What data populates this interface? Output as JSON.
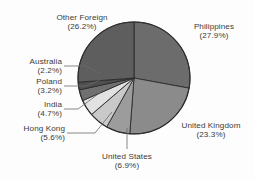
{
  "chart_data": {
    "type": "pie",
    "title": "",
    "subtitle": "",
    "xlabel": "",
    "ylabel": "",
    "legend_position": "none",
    "grid": false,
    "value_unit": "percent",
    "start_angle_deg": 0,
    "direction": "clockwise",
    "categories": [
      "Philippines",
      "United Kingdom",
      "United States",
      "Hong Kong",
      "India",
      "Poland",
      "Australia",
      "Other Foreign"
    ],
    "values": [
      27.9,
      23.3,
      6.9,
      5.6,
      4.7,
      3.2,
      2.2,
      26.2
    ],
    "slices": [
      {
        "label": "Philippines",
        "pct_text": "(27.9%)",
        "value": 27.9,
        "color": "#6c6c6c"
      },
      {
        "label": "United Kingdom",
        "pct_text": "(23.3%)",
        "value": 23.3,
        "color": "#8b8b8b"
      },
      {
        "label": "United States",
        "pct_text": "(6.9%)",
        "value": 6.9,
        "color": "#9c9c9c"
      },
      {
        "label": "Hong Kong",
        "pct_text": "(5.6%)",
        "value": 5.6,
        "color": "#c9c9c9"
      },
      {
        "label": "India",
        "pct_text": "(4.7%)",
        "value": 4.7,
        "color": "#e2e2e2"
      },
      {
        "label": "Poland",
        "pct_text": "(3.2%)",
        "value": 3.2,
        "color": "#707070"
      },
      {
        "label": "Australia",
        "pct_text": "(2.2%)",
        "value": 2.2,
        "color": "#4f4f4f"
      },
      {
        "label": "Other Foreign",
        "pct_text": "(26.2%)",
        "value": 26.2,
        "color": "#5e5e5e"
      }
    ],
    "geometry": {
      "cx": 134,
      "cy": 78,
      "r": 56
    },
    "colors": {
      "text": "#3b3b3b",
      "outline": "#2b2b2b",
      "leader": "#6a6a6a",
      "background": "#fdfdfd"
    }
  },
  "labels": {
    "other_foreign": {
      "name": "Other Foreign",
      "pct": "(26.2%)"
    },
    "philippines": {
      "name": "Philippines",
      "pct": "(27.9%)"
    },
    "australia": {
      "name": "Australia",
      "pct": "(2.2%)"
    },
    "poland": {
      "name": "Poland",
      "pct": "(3.2%)"
    },
    "india": {
      "name": "India",
      "pct": "(4.7%)"
    },
    "hong_kong": {
      "name": "Hong Kong",
      "pct": "(5.6%)"
    },
    "united_states": {
      "name": "United States",
      "pct": "(6.9%)"
    },
    "united_kingdom": {
      "name": "United Kingdom",
      "pct": "(23.3%)"
    }
  }
}
